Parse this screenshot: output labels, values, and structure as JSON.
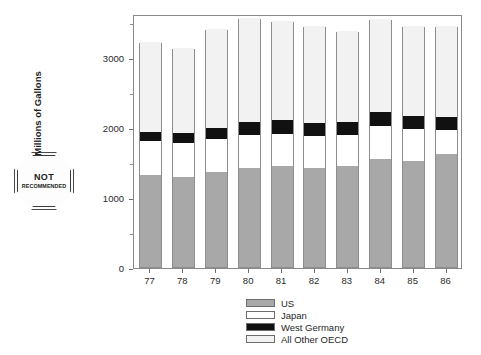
{
  "stamp": {
    "line1": "NOT",
    "line2": "RECOMMENDED"
  },
  "chart_data": {
    "type": "bar",
    "subtype": "stacked",
    "title": "",
    "xlabel": "",
    "ylabel": "Millions of Gallons",
    "categories": [
      "77",
      "78",
      "79",
      "80",
      "81",
      "82",
      "83",
      "84",
      "85",
      "86"
    ],
    "ylim": [
      0,
      3700
    ],
    "yticks": [
      0,
      1000,
      2000,
      3000
    ],
    "yticklabels": [
      "0",
      "1000",
      "2000",
      "3000"
    ],
    "minor_yticks": [
      500,
      1500,
      2500,
      3500
    ],
    "grid": false,
    "legend_position": "bottom-center",
    "series": [
      {
        "name": "US",
        "color": "#a8a8a8",
        "values": [
          1320,
          1290,
          1360,
          1420,
          1440,
          1420,
          1450,
          1550,
          1520,
          1610
        ]
      },
      {
        "name": "Japan",
        "color": "#ffffff",
        "values": [
          480,
          480,
          470,
          460,
          460,
          450,
          430,
          460,
          450,
          350
        ]
      },
      {
        "name": "West Germany",
        "color": "#111111",
        "values": [
          130,
          140,
          160,
          190,
          200,
          190,
          190,
          200,
          190,
          190
        ]
      },
      {
        "name": "All Other OECD",
        "color": "#f2f2f2",
        "values": [
          1290,
          1220,
          1410,
          1490,
          1420,
          1390,
          1300,
          1340,
          1290,
          1300
        ]
      }
    ],
    "totals": [
      3220,
      3130,
      3400,
      3560,
      3520,
      3450,
      3370,
      3550,
      3450,
      3450
    ]
  }
}
